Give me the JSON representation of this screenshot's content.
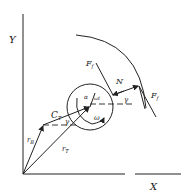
{
  "diagram": {
    "axes": {
      "x_label": "X",
      "y_label": "Y"
    },
    "vectors": {
      "r_B": "r",
      "r_B_sub": "B",
      "r_T": "r",
      "r_T_sub": "T",
      "C_T": "C",
      "C_T_sub": "T"
    },
    "forces": {
      "F_f_upper": "F",
      "F_f_upper_sub": "f",
      "F_f_right": "F",
      "F_f_right_sub": "f",
      "N": "N"
    },
    "angles": {
      "gamma_left": "γ",
      "gamma_right": "γ",
      "alpha": "α",
      "omega_t": "ωt",
      "omega": "ω"
    }
  }
}
